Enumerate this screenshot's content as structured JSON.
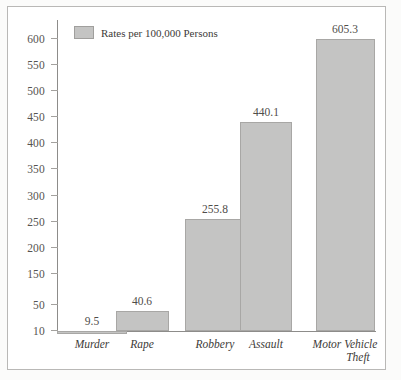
{
  "legend": {
    "label": "Rates per 100,000 Persons",
    "swatch_color": "#c4c4c3",
    "position": "top-left-inside"
  },
  "axis": {
    "y_ticks": [
      600,
      550,
      500,
      450,
      400,
      350,
      300,
      250,
      200,
      150,
      50,
      10
    ],
    "y_tick_labels": [
      "600",
      "550",
      "500",
      "450",
      "400",
      "350",
      "300",
      "250",
      "200",
      "150",
      "50",
      "10"
    ]
  },
  "bars": [
    {
      "category": "Murder",
      "value": 9.5,
      "value_label": "9.5"
    },
    {
      "category": "Rape",
      "value": 40.6,
      "value_label": "40.6"
    },
    {
      "category": "Robbery",
      "value": 255.8,
      "value_label": "255.8"
    },
    {
      "category": "Assault",
      "value": 440.1,
      "value_label": "440.1"
    },
    {
      "category": "Motor Vehicle\nTheft",
      "value": 605.3,
      "value_label": "605.3"
    }
  ],
  "category_labels": [
    {
      "line1": "Murder",
      "line2": ""
    },
    {
      "line1": "Rape",
      "line2": ""
    },
    {
      "line1": "Robbery",
      "line2": ""
    },
    {
      "line1": "Assault",
      "line2": ""
    },
    {
      "line1": "Motor Vehicle",
      "line2": "Theft"
    }
  ],
  "chart_data": {
    "type": "bar",
    "title": "",
    "subtitle": "",
    "xlabel": "",
    "ylabel": "",
    "categories": [
      "Murder",
      "Rape",
      "Robbery",
      "Assault",
      "Motor Vehicle Theft"
    ],
    "values": [
      9.5,
      40.6,
      255.8,
      440.1,
      605.3
    ],
    "data_labels": [
      "9.5",
      "40.6",
      "255.8",
      "440.1",
      "605.3"
    ],
    "legend": [
      "Rates per 100,000 Persons"
    ],
    "legend_position": "upper-left inside plot area",
    "ylim": [
      10,
      620
    ],
    "yticks": [
      10,
      50,
      150,
      200,
      250,
      300,
      350,
      400,
      450,
      500,
      550,
      600
    ],
    "ytick_labels": [
      "10",
      "50",
      "150",
      "200",
      "250",
      "300",
      "350",
      "400",
      "450",
      "500",
      "550",
      "600"
    ],
    "grid": false,
    "bar_color": "#c4c4c3",
    "bar_edge_color": "#a8a7a5",
    "orientation": "vertical",
    "note": "Y axis tick labels skip 100; spacing between 10 and 50 is compressed relative to other 50-unit intervals."
  }
}
